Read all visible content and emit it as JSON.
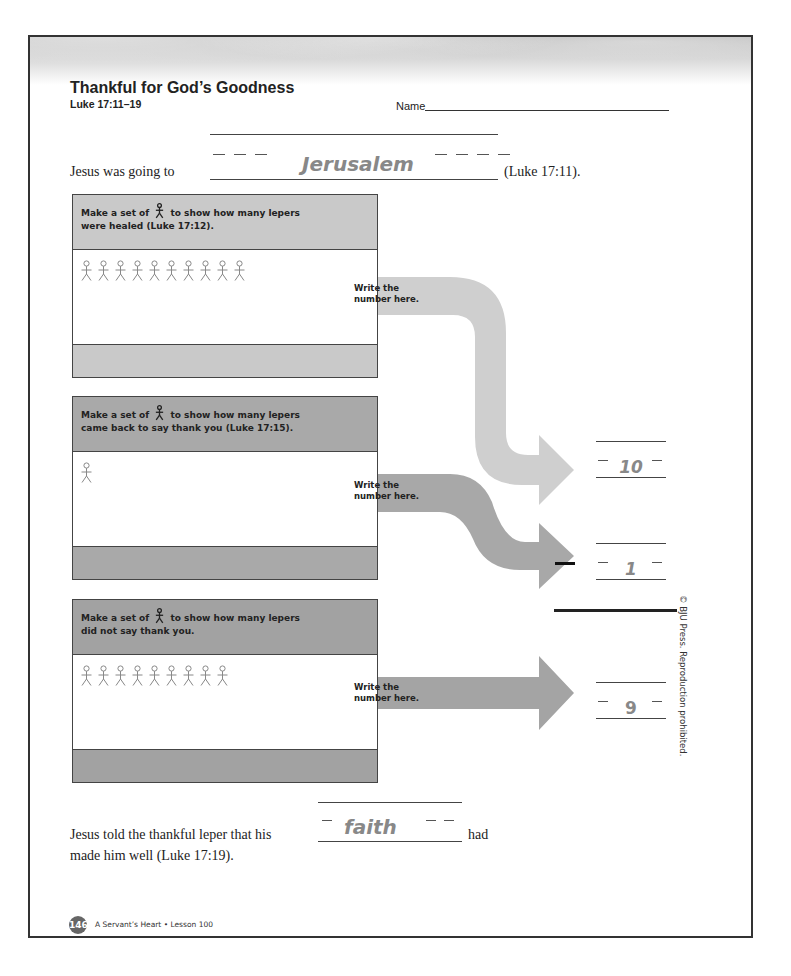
{
  "header": {
    "title": "Thankful for God’s Goodness",
    "reference": "Luke 17:11–19",
    "name_label": "Name"
  },
  "question1": {
    "prefix": "Jesus was going to",
    "answer": "Jerusalem",
    "suffix": "(Luke 17:11)."
  },
  "sets": [
    {
      "instruction_before": "Make a set of",
      "instruction_after": "to show how many lepers",
      "instruction_line2": "were healed (Luke 17:12).",
      "figure_count": 10,
      "arrow_label_line1": "Write the",
      "arrow_label_line2": "number here.",
      "answer": "10",
      "arrow_color": "#cfcfcf",
      "header_color": "#c9c9c9"
    },
    {
      "instruction_before": "Make a set of",
      "instruction_after": "to show how many lepers",
      "instruction_line2": "came back to say thank you (Luke 17:15).",
      "figure_count": 1,
      "arrow_label_line1": "Write the",
      "arrow_label_line2": "number here.",
      "answer": "1",
      "arrow_color": "#a8a8a8",
      "header_color": "#a9a9a9"
    },
    {
      "instruction_before": "Make a set of",
      "instruction_after": "to show how many lepers",
      "instruction_line2": "did not say thank you.",
      "figure_count": 9,
      "arrow_label_line1": "Write the",
      "arrow_label_line2": "number here.",
      "answer": "9",
      "arrow_color": "#a4a4a4",
      "header_color": "#a2a2a2"
    }
  ],
  "subtraction": {
    "minus_sign": "−"
  },
  "question2": {
    "prefix": "Jesus told the thankful leper that his",
    "answer": "faith",
    "suffix": "had",
    "line2": "made him well (Luke 17:19)."
  },
  "copyright": "© BJU Press. Reproduction prohibited.",
  "footer": {
    "page_number": "146",
    "text": "A Servant’s Heart • Lesson 100"
  },
  "colors": {
    "answer_text": "#888888",
    "border": "#333333"
  }
}
